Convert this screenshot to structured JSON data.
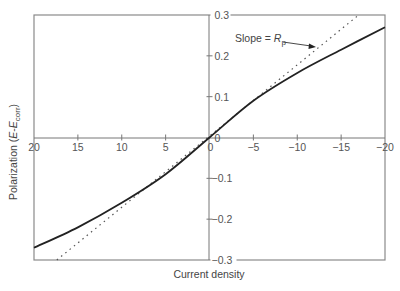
{
  "chart_data": {
    "type": "line",
    "title": "",
    "xlabel": "Current density",
    "ylabel_prefix": "Polarization (",
    "ylabel_E": "E",
    "ylabel_dash": "-",
    "ylabel_Ecorr_E": "E",
    "ylabel_sub": "corr",
    "ylabel_suffix": ")",
    "xlim": [
      20,
      -20
    ],
    "ylim": [
      -0.3,
      0.3
    ],
    "x_ticks": [
      {
        "value": 20,
        "label": "20"
      },
      {
        "value": 15,
        "label": "15"
      },
      {
        "value": 10,
        "label": "10"
      },
      {
        "value": 5,
        "label": "5"
      },
      {
        "value": 0,
        "label": "0"
      },
      {
        "value": -5,
        "label": "−5"
      },
      {
        "value": -10,
        "label": "−10"
      },
      {
        "value": -15,
        "label": "−15"
      },
      {
        "value": -20,
        "label": "−20"
      }
    ],
    "y_ticks": [
      {
        "value": 0.3,
        "label": "0.3"
      },
      {
        "value": 0.2,
        "label": "0.2"
      },
      {
        "value": 0.1,
        "label": "0.1"
      },
      {
        "value": 0,
        "label": "0"
      },
      {
        "value": -0.1,
        "label": "−0.1"
      },
      {
        "value": -0.2,
        "label": "−0.2"
      },
      {
        "value": -0.3,
        "label": "−0.3"
      }
    ],
    "grid": false,
    "series": [
      {
        "name": "Polarization curve",
        "style": "solid",
        "x": [
          20,
          15,
          10,
          5,
          0,
          -5,
          -10,
          -15,
          -20
        ],
        "y": [
          -0.27,
          -0.22,
          -0.16,
          -0.09,
          0.0,
          0.09,
          0.158,
          0.215,
          0.27
        ]
      },
      {
        "name": "Linear slope (Rp)",
        "style": "dotted",
        "x": [
          17.4,
          -17
        ],
        "y": [
          -0.3,
          0.3
        ]
      }
    ],
    "annotations": [
      {
        "text_prefix": "Slope = ",
        "text_italic": "R",
        "text_sub": "p",
        "arrow_to": {
          "x": -12,
          "y": 0.22
        }
      }
    ]
  }
}
